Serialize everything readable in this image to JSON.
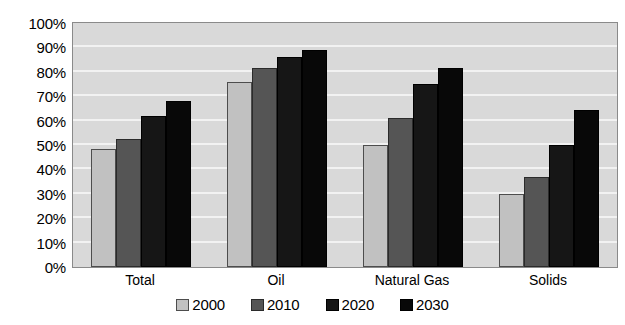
{
  "chart_data": {
    "type": "bar",
    "title": "",
    "subtitle": "",
    "xlabel": "",
    "ylabel": "",
    "ylim": [
      0,
      100
    ],
    "y_unit": "%",
    "grid": true,
    "legend_position": "bottom",
    "categories": [
      "Total",
      "Oil",
      "Natural Gas",
      "Solids"
    ],
    "y_ticks": [
      "0%",
      "10%",
      "20%",
      "30%",
      "40%",
      "50%",
      "60%",
      "70%",
      "80%",
      "90%",
      "100%"
    ],
    "y_tick_values": [
      0,
      10,
      20,
      30,
      40,
      50,
      60,
      70,
      80,
      90,
      100
    ],
    "series": [
      {
        "name": "2000",
        "color": "#c1c1c1",
        "values": [
          48.5,
          76.0,
          50.0,
          30.0
        ]
      },
      {
        "name": "2010",
        "color": "#555555",
        "values": [
          52.5,
          81.5,
          61.0,
          37.0
        ]
      },
      {
        "name": "2020",
        "color": "#161616",
        "values": [
          62.0,
          86.0,
          75.0,
          50.0
        ]
      },
      {
        "name": "2030",
        "color": "#080808",
        "values": [
          68.0,
          89.0,
          81.5,
          64.5
        ]
      }
    ]
  },
  "plot": {
    "background_color": "#d9d9d9",
    "gridline_color": "#f2f2f2",
    "border_color": "#8a8a8a"
  }
}
